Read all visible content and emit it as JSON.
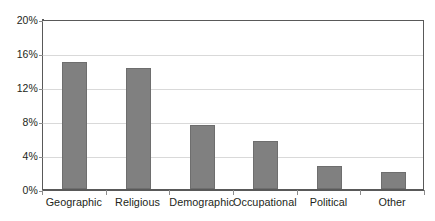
{
  "chart_data": {
    "type": "bar",
    "title": "",
    "subtitle": "",
    "xlabel": "",
    "ylabel": "",
    "categories": [
      "Geographic",
      "Religious",
      "Demographic",
      "Occupational",
      "Political",
      "Other"
    ],
    "values": [
      15.0,
      14.2,
      7.5,
      5.6,
      2.7,
      2.0
    ],
    "series": [
      {
        "name": "",
        "values": [
          15.0,
          14.2,
          7.5,
          5.6,
          2.7,
          2.0
        ]
      }
    ],
    "ylim": [
      0,
      20
    ],
    "yticks": [
      0,
      4,
      8,
      12,
      16,
      20
    ],
    "ytick_labels": [
      "0%",
      "4%",
      "8%",
      "12%",
      "16%",
      "20%"
    ],
    "grid": "horizontal",
    "legend": "none",
    "bar_color": "#808080",
    "bar_edge_color": "#6e6e6e",
    "gridline_color": "#d9d9d9",
    "axis_color": "#595959",
    "text_color": "#231f20",
    "background": "#ffffff",
    "annotations": []
  }
}
